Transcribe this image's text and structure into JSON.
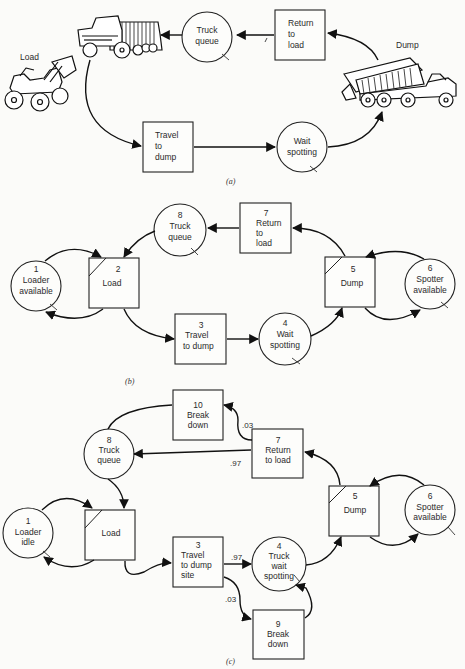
{
  "figure": {
    "a": {
      "caption": "(a)",
      "labels": {
        "load": "Load",
        "dump": "Dump"
      },
      "nodes": {
        "truck_queue": [
          "Truck",
          "queue"
        ],
        "return_to_load": [
          "Return",
          "to",
          "load"
        ],
        "travel_to_dump": [
          "Travel",
          "to",
          "dump"
        ],
        "wait_spotting": [
          "Wait",
          "spotting"
        ]
      },
      "icons": [
        "front-loader-icon",
        "dump-truck-icon",
        "dumping-truck-icon"
      ]
    },
    "b": {
      "caption": "(b)",
      "nodes": [
        {
          "id": "1",
          "type": "queue",
          "lines": [
            "Loader",
            "available"
          ]
        },
        {
          "id": "2",
          "type": "combi",
          "lines": [
            "Load"
          ]
        },
        {
          "id": "3",
          "type": "normal",
          "lines": [
            "Travel",
            "to dump"
          ]
        },
        {
          "id": "4",
          "type": "queue",
          "lines": [
            "Wait",
            "spotting"
          ]
        },
        {
          "id": "5",
          "type": "combi",
          "lines": [
            "Dump"
          ]
        },
        {
          "id": "6",
          "type": "queue",
          "lines": [
            "Spotter",
            "available"
          ]
        },
        {
          "id": "7",
          "type": "normal",
          "lines": [
            "Return",
            "to",
            "load"
          ]
        },
        {
          "id": "8",
          "type": "queue",
          "lines": [
            "Truck",
            "queue"
          ]
        }
      ]
    },
    "c": {
      "caption": "(c)",
      "nodes": [
        {
          "id": "1",
          "type": "queue",
          "lines": [
            "Loader",
            "idle"
          ]
        },
        {
          "id": "",
          "type": "combi",
          "lines": [
            "Load"
          ]
        },
        {
          "id": "3",
          "type": "normal",
          "lines": [
            "Travel",
            "to dump",
            "site"
          ]
        },
        {
          "id": "4",
          "type": "queue",
          "lines": [
            "Truck",
            "wait",
            "spotting"
          ]
        },
        {
          "id": "5",
          "type": "combi",
          "lines": [
            "Dump"
          ]
        },
        {
          "id": "6",
          "type": "queue",
          "lines": [
            "Spotter",
            "available"
          ]
        },
        {
          "id": "7",
          "type": "normal",
          "lines": [
            "Return",
            "to load"
          ]
        },
        {
          "id": "8",
          "type": "queue",
          "lines": [
            "Truck",
            "queue"
          ]
        },
        {
          "id": "9",
          "type": "normal",
          "lines": [
            "Break",
            "down"
          ]
        },
        {
          "id": "10",
          "type": "normal",
          "lines": [
            "Break",
            "down"
          ]
        }
      ],
      "probabilities": {
        "return_to_breakdown": ".03",
        "return_to_queue": ".97",
        "travel_to_wait": ".97",
        "travel_to_breakdown": ".03"
      }
    }
  }
}
